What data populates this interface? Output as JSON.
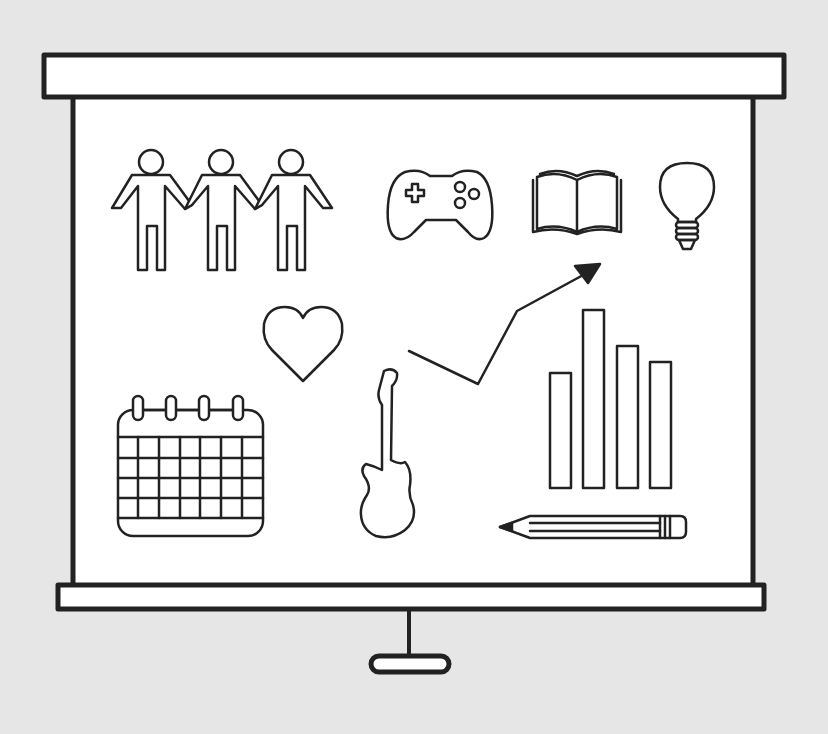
{
  "illustration": {
    "subject": "projector screen with infographic icons",
    "colors": {
      "background": "#e6e6e6",
      "screen": "#ffffff",
      "stroke": "#222222"
    },
    "icons": [
      "people-holding-hands-icon",
      "game-controller-icon",
      "open-book-icon",
      "light-bulb-icon",
      "heart-icon",
      "trend-arrow-icon",
      "bar-chart-icon",
      "calendar-icon",
      "electric-guitar-icon",
      "pencil-icon"
    ],
    "bar_chart": {
      "bars": 4,
      "relative_heights": [
        115,
        178,
        142,
        127
      ]
    },
    "calendar": {
      "rings": 4,
      "columns": 7,
      "rows": 4
    }
  }
}
